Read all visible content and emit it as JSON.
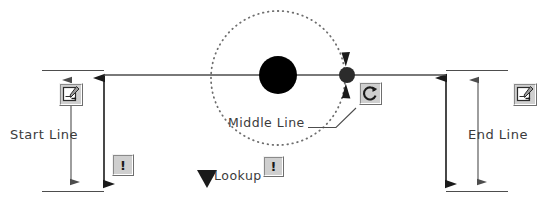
{
  "diagram": {
    "labels": {
      "start_line": "Start  Line",
      "end_line": "End  Line",
      "middle_line": "Middle  Line",
      "lookup": "Lookup"
    },
    "icons": {
      "edit_left": "edit-page-icon",
      "edit_right": "edit-page-icon",
      "warning_left": "warning-exclamation-icon",
      "warning_middle": "warning-exclamation-icon",
      "rotate": "rotate-refresh-icon",
      "lookup_marker": "down-triangle-icon"
    },
    "glyphs": {
      "exclamation": "!"
    },
    "colors": {
      "line": "#4d4d4d",
      "body": "#000000",
      "orbit": "#7a7a7a",
      "text": "#3b3b3b",
      "icon_face": "#cfcfcf",
      "background": "#ffffff"
    },
    "geometry": {
      "axis_y": 75,
      "center_x": 278,
      "body_radius": 19,
      "orbit_radius": 67,
      "satellite_x": 347,
      "satellite_radius": 8,
      "start_extension_x": 42,
      "start_arrow_x": 104,
      "end_arrow_x": 446,
      "end_extension_x": 508,
      "span_top_y": 66,
      "span_bottom_y": 196
    }
  }
}
